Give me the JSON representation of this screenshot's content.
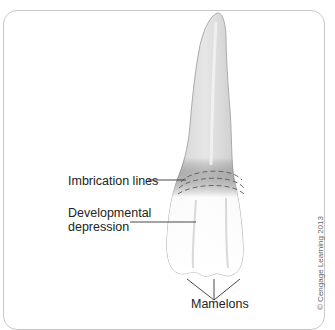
{
  "figure": {
    "labels": {
      "imbrication_lines": "Imbrication lines",
      "developmental_depression_line1": "Developmental",
      "developmental_depression_line2": "depression",
      "mamelons": "Mamelons"
    },
    "copyright": "© Cengage Learning 2013",
    "colors": {
      "frame": "#c8c8c8",
      "tooth_root": "#d6d6d6",
      "tooth_crown": "#f1f1f1",
      "outline": "#9a9a9a",
      "leader_lines": "#333333",
      "dashes": "#666666"
    }
  }
}
